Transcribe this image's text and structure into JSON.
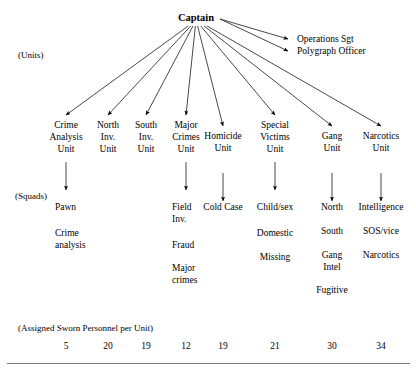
{
  "root": {
    "label": "Captain",
    "x": 196,
    "y": 12
  },
  "side_labels": [
    {
      "name": "units-label",
      "text": "(Units)",
      "x": 18,
      "y": 50
    },
    {
      "name": "squads-label",
      "text": "(Squads)",
      "x": 15,
      "y": 191
    },
    {
      "name": "personnel-label",
      "text": "(Assigned Sworn Personnel per Unit)",
      "x": 18,
      "y": 323
    }
  ],
  "direct_reports": [
    {
      "label": "Operations Sgt",
      "x": 297,
      "y": 34
    },
    {
      "label": "Polygraph Officer",
      "x": 297,
      "y": 46
    }
  ],
  "units": [
    {
      "name": "crime-analysis-unit",
      "label": "Crime\nAnalysis\nUnit",
      "x": 66,
      "y": 120,
      "personnel": "5",
      "squads": {
        "align": "left",
        "x": 55,
        "items": [
          {
            "text": "Pawn",
            "y": 202
          },
          {
            "text": "Crime\nanalysis",
            "y": 228
          }
        ]
      }
    },
    {
      "name": "north-inv-unit",
      "label": "North\nInv.\nUnit",
      "x": 108,
      "y": 120,
      "personnel": "20",
      "squads": null
    },
    {
      "name": "south-inv-unit",
      "label": "South\nInv.\nUnit",
      "x": 146,
      "y": 120,
      "personnel": "19",
      "squads": null
    },
    {
      "name": "major-crimes-unit",
      "label": "Major\nCrimes\nUnit",
      "x": 186,
      "y": 120,
      "personnel": "12",
      "squads": {
        "align": "left",
        "x": 172,
        "items": [
          {
            "text": "Field\nInv.",
            "y": 202
          },
          {
            "text": "Fraud",
            "y": 240
          },
          {
            "text": "Major\ncrimes",
            "y": 263
          }
        ]
      }
    },
    {
      "name": "homicide-unit",
      "label": "Homicide\nUnit",
      "x": 223,
      "y": 131,
      "personnel": "19",
      "squads": {
        "align": "center",
        "x": 223,
        "items": [
          {
            "text": "Cold Case",
            "y": 202
          }
        ]
      }
    },
    {
      "name": "special-victims-unit",
      "label": "Special\nVictims\nUnit",
      "x": 275,
      "y": 120,
      "personnel": "21",
      "squads": {
        "align": "center",
        "x": 275,
        "items": [
          {
            "text": "Child/sex",
            "y": 202
          },
          {
            "text": "Domestic",
            "y": 228
          },
          {
            "text": "Missing",
            "y": 252
          }
        ]
      }
    },
    {
      "name": "gang-unit",
      "label": "Gang\nUnit",
      "x": 332,
      "y": 131,
      "personnel": "30",
      "squads": {
        "align": "center",
        "x": 332,
        "items": [
          {
            "text": "North",
            "y": 202
          },
          {
            "text": "South",
            "y": 226
          },
          {
            "text": "Gang\nIntel",
            "y": 250
          },
          {
            "text": "Fugitive",
            "y": 285
          }
        ]
      }
    },
    {
      "name": "narcotics-unit",
      "label": "Narcotics\nUnit",
      "x": 381,
      "y": 131,
      "personnel": "34",
      "squads": {
        "align": "center",
        "x": 381,
        "items": [
          {
            "text": "Intelligence",
            "y": 202
          },
          {
            "text": "SOS/vice",
            "y": 226
          },
          {
            "text": "Narcotics",
            "y": 250
          }
        ]
      }
    }
  ],
  "personnel_row": {
    "y": 341,
    "values": [
      "5",
      "20",
      "19",
      "12",
      "19",
      "21",
      "30",
      "34"
    ]
  },
  "colors": {
    "ink": "#000000",
    "rule": "#808080",
    "background": "#ffffff"
  }
}
